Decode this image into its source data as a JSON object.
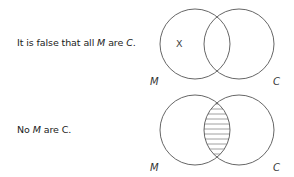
{
  "diagrams": [
    {
      "statement": {
        "prefix": "It is false that all ",
        "subject": "M",
        "middle": " are ",
        "predicate": "C",
        "suffix": "."
      },
      "left_label": "M",
      "right_label": "C",
      "marker": "X",
      "marker_region": "M-only",
      "shaded_region": null
    },
    {
      "statement": {
        "prefix": "No ",
        "subject": "M",
        "middle": " are ",
        "predicate": "C",
        "suffix": "."
      },
      "left_label": "M",
      "right_label": "C",
      "marker": null,
      "marker_region": null,
      "shaded_region": "M-and-C"
    }
  ]
}
